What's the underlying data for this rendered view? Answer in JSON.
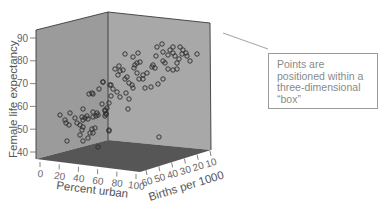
{
  "chart_data": {
    "type": "scatter3d",
    "title": "",
    "axes": {
      "y": {
        "label": "Female life expectancy",
        "ticks": [
          40,
          50,
          60,
          70,
          80,
          90
        ],
        "range": [
          40,
          90
        ]
      },
      "x": {
        "label": "Percent urban",
        "ticks": [
          0,
          20,
          40,
          60,
          80,
          100
        ],
        "range": [
          0,
          100
        ]
      },
      "z": {
        "label": "Births per 1000",
        "ticks": [
          60,
          50,
          40,
          30,
          20,
          10
        ],
        "range": [
          60,
          10
        ]
      }
    },
    "grid": false,
    "legend": null,
    "marker": "open-circle",
    "colors": {
      "left_wall": "#9b9b9b",
      "right_wall": "#a8a8a8",
      "floor": "#565656",
      "edges": "#3a3a3a",
      "marker": "#2a2a2a"
    },
    "points_screen_px": [
      [
        60,
        115
      ],
      [
        65,
        120
      ],
      [
        66,
        123
      ],
      [
        69,
        125
      ],
      [
        70,
        113
      ],
      [
        75,
        118
      ],
      [
        77,
        123
      ],
      [
        80,
        125
      ],
      [
        82,
        117
      ],
      [
        83,
        120
      ],
      [
        83,
        109
      ],
      [
        85,
        118
      ],
      [
        87,
        116
      ],
      [
        88,
        119
      ],
      [
        83,
        127
      ],
      [
        82,
        130
      ],
      [
        80,
        135
      ],
      [
        83,
        141
      ],
      [
        67,
        141
      ],
      [
        88,
        138
      ],
      [
        90,
        133
      ],
      [
        92,
        129
      ],
      [
        93,
        133
      ],
      [
        95,
        128
      ],
      [
        93,
        112
      ],
      [
        93,
        117
      ],
      [
        97,
        113
      ],
      [
        96,
        116
      ],
      [
        98,
        115
      ],
      [
        102,
        104
      ],
      [
        105,
        110
      ],
      [
        106,
        114
      ],
      [
        107,
        108
      ],
      [
        105,
        116
      ],
      [
        109,
        103
      ],
      [
        109,
        131
      ],
      [
        89,
        94
      ],
      [
        92,
        93
      ],
      [
        93,
        94
      ],
      [
        99,
        89
      ],
      [
        103,
        82
      ],
      [
        110,
        85
      ],
      [
        111,
        96
      ],
      [
        98,
        147
      ],
      [
        125,
        54
      ],
      [
        133,
        57
      ],
      [
        138,
        53
      ],
      [
        135,
        65
      ],
      [
        137,
        63
      ],
      [
        140,
        62
      ],
      [
        134,
        68
      ],
      [
        115,
        69
      ],
      [
        119,
        66
      ],
      [
        120,
        71
      ],
      [
        123,
        70
      ],
      [
        118,
        75
      ],
      [
        125,
        79
      ],
      [
        127,
        77
      ],
      [
        129,
        83
      ],
      [
        132,
        85
      ],
      [
        133,
        88
      ],
      [
        137,
        73
      ],
      [
        139,
        79
      ],
      [
        143,
        75
      ],
      [
        143,
        79
      ],
      [
        147,
        73
      ],
      [
        152,
        67
      ],
      [
        153,
        65
      ],
      [
        155,
        68
      ],
      [
        156,
        56
      ],
      [
        157,
        47
      ],
      [
        162,
        44
      ],
      [
        163,
        52
      ],
      [
        163,
        61
      ],
      [
        165,
        63
      ],
      [
        168,
        55
      ],
      [
        170,
        50
      ],
      [
        173,
        53
      ],
      [
        173,
        47
      ],
      [
        175,
        56
      ],
      [
        177,
        63
      ],
      [
        179,
        59
      ],
      [
        180,
        47
      ],
      [
        182,
        54
      ],
      [
        183,
        50
      ],
      [
        186,
        53
      ],
      [
        187,
        56
      ],
      [
        190,
        61
      ],
      [
        197,
        54
      ],
      [
        168,
        69
      ],
      [
        173,
        70
      ],
      [
        177,
        69
      ],
      [
        163,
        79
      ],
      [
        158,
        84
      ],
      [
        151,
        87
      ],
      [
        145,
        88
      ],
      [
        129,
        99
      ],
      [
        128,
        109
      ],
      [
        126,
        93
      ],
      [
        120,
        97
      ],
      [
        117,
        92
      ],
      [
        113,
        89
      ],
      [
        111,
        85
      ],
      [
        109,
        130
      ],
      [
        159,
        137
      ],
      [
        103,
        82
      ],
      [
        105,
        111
      ],
      [
        106,
        114
      ]
    ],
    "annotations": [
      {
        "text": "Points are positioned within a three-dimensional “box”",
        "type": "callout"
      }
    ]
  },
  "callout": {
    "lines": [
      "Points are",
      "positioned within a",
      "three-dimensional",
      "“box”"
    ]
  }
}
